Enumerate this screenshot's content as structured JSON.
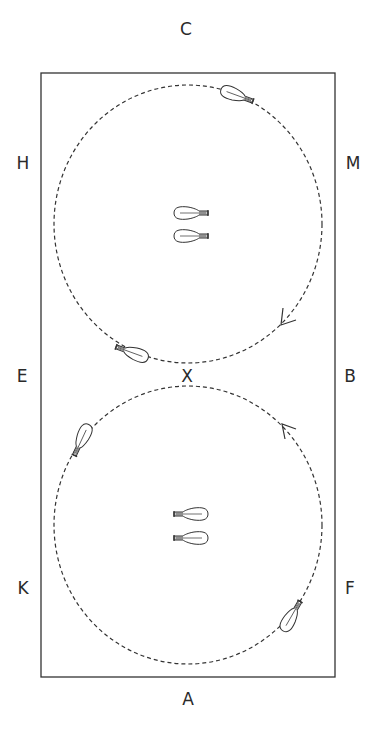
{
  "diagram": {
    "colors": {
      "line": "#333333",
      "background": "#ffffff"
    },
    "arena": {
      "x": 41,
      "y": 73,
      "width": 294,
      "height": 604
    },
    "markers": {
      "C": "C",
      "H": "H",
      "M": "M",
      "E": "E",
      "X": "X",
      "B": "B",
      "K": "K",
      "F": "F",
      "A": "A"
    },
    "circles": [
      {
        "name": "upper-circle",
        "cx": 188,
        "cy": 225,
        "rx": 134,
        "ry": 139,
        "direction": "clockwise"
      },
      {
        "name": "lower-circle",
        "cx": 188,
        "cy": 525,
        "rx": 134,
        "ry": 139,
        "direction": "counterclockwise"
      }
    ],
    "horses": [
      {
        "name": "horse-upper-circle-top",
        "x": 235,
        "y": 95,
        "angle": 20
      },
      {
        "name": "horse-upper-center-1",
        "x": 190,
        "y": 213,
        "angle": 0
      },
      {
        "name": "horse-upper-center-2",
        "x": 190,
        "y": 236,
        "angle": 0
      },
      {
        "name": "horse-upper-circle-bottom",
        "x": 132,
        "y": 354,
        "angle": 200
      },
      {
        "name": "horse-lower-circle-top",
        "x": 82,
        "y": 440,
        "angle": 120
      },
      {
        "name": "horse-lower-center-1",
        "x": 188,
        "y": 514,
        "angle": 180
      },
      {
        "name": "horse-lower-center-2",
        "x": 188,
        "y": 537,
        "angle": 180
      },
      {
        "name": "horse-lower-circle-bottom",
        "x": 292,
        "y": 615,
        "angle": 300
      }
    ]
  }
}
